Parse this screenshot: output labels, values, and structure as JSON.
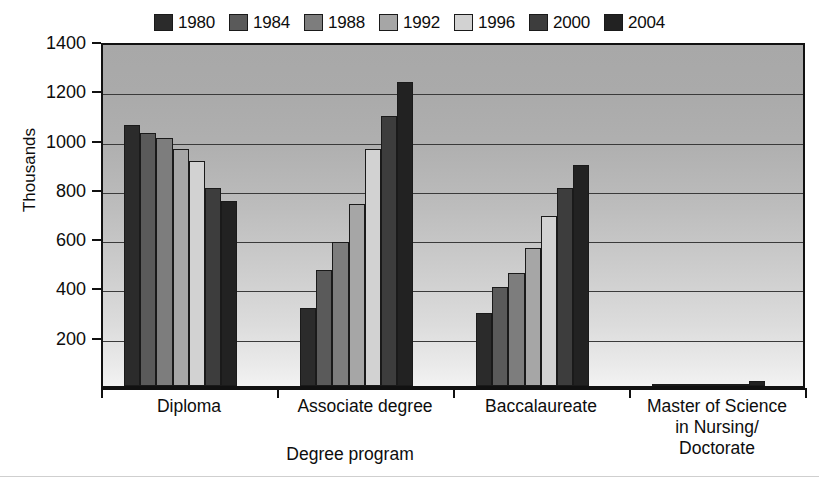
{
  "chart_data": {
    "type": "bar",
    "title": "",
    "xlabel": "Degree program",
    "ylabel": "Thousands",
    "ylim": [
      0,
      1400
    ],
    "yticks": [
      200,
      400,
      600,
      800,
      1000,
      1200,
      1400
    ],
    "grid": true,
    "legend_position": "top",
    "categories": [
      "Diploma",
      "Associate degree",
      "Baccalaureate",
      "Master of Science in Nursing/ Doctorate"
    ],
    "category_lines": [
      [
        "Diploma"
      ],
      [
        "Associate degree"
      ],
      [
        "Baccalaureate"
      ],
      [
        "Master of Science",
        "in Nursing/",
        "Doctorate"
      ]
    ],
    "series": [
      {
        "name": "1980",
        "color": "#2b2b2b",
        "values": [
          1060,
          315,
          295,
          2
        ]
      },
      {
        "name": "1984",
        "color": "#5a5a5a",
        "values": [
          1025,
          470,
          400,
          3
        ]
      },
      {
        "name": "1988",
        "color": "#7d7d7d",
        "values": [
          1005,
          585,
          460,
          4
        ]
      },
      {
        "name": "1992",
        "color": "#a6a6a6",
        "values": [
          960,
          740,
          560,
          5
        ]
      },
      {
        "name": "1996",
        "color": "#d2d2d2",
        "values": [
          915,
          960,
          690,
          6
        ]
      },
      {
        "name": "2000",
        "color": "#3d3d3d",
        "values": [
          805,
          1095,
          805,
          10
        ]
      },
      {
        "name": "2004",
        "color": "#222222",
        "values": [
          750,
          1235,
          895,
          20
        ]
      }
    ]
  },
  "legend": {
    "items": [
      {
        "label": "1980"
      },
      {
        "label": "1984"
      },
      {
        "label": "1988"
      },
      {
        "label": "1992"
      },
      {
        "label": "1996"
      },
      {
        "label": "2000"
      },
      {
        "label": "2004"
      }
    ]
  }
}
